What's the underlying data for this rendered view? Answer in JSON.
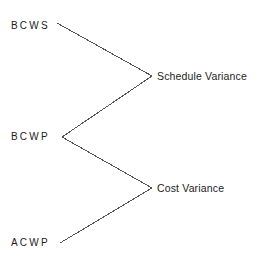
{
  "diagram": {
    "type": "earned-value-variance-diagram",
    "line_color": "#555555",
    "text_color": "#1c1c1c",
    "background_color": "#ffffff",
    "inputs": [
      {
        "id": "bcws",
        "label": "BCWS",
        "x": 57,
        "y": 23
      },
      {
        "id": "bcwp",
        "label": "BCWP",
        "x": 62,
        "y": 137
      },
      {
        "id": "acwp",
        "label": "ACWP",
        "x": 60,
        "y": 243
      }
    ],
    "outcomes": [
      {
        "id": "schedule_variance",
        "label": "Schedule Variance",
        "x": 152,
        "y": 76
      },
      {
        "id": "cost_variance",
        "label": "Cost Variance",
        "x": 152,
        "y": 188
      }
    ],
    "connectors": [
      {
        "id": "bcws-to-schedule-variance",
        "from": "bcws",
        "to": "schedule_variance",
        "x1": 57,
        "y1": 23,
        "x2": 152,
        "y2": 76
      },
      {
        "id": "bcwp-to-schedule-variance",
        "from": "bcwp",
        "to": "schedule_variance",
        "x1": 62,
        "y1": 137,
        "x2": 152,
        "y2": 76
      },
      {
        "id": "bcwp-to-cost-variance",
        "from": "bcwp",
        "to": "cost_variance",
        "x1": 62,
        "y1": 137,
        "x2": 152,
        "y2": 188
      },
      {
        "id": "acwp-to-cost-variance",
        "from": "acwp",
        "to": "cost_variance",
        "x1": 60,
        "y1": 243,
        "x2": 152,
        "y2": 188
      }
    ]
  }
}
